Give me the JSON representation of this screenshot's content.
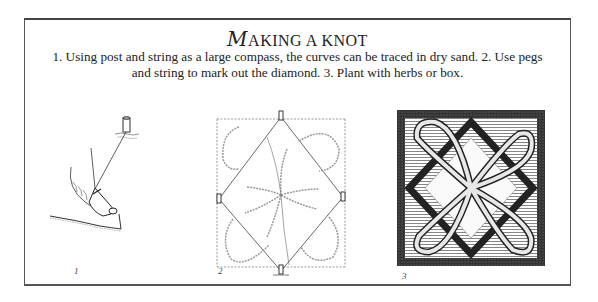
{
  "title": {
    "initial": "M",
    "rest": "AKING A KNOT"
  },
  "caption": "1.  Using post and string as a large compass, the curves can be traced in dry sand. 2.  Use pegs and string to mark out the diamond. 3.  Plant with herbs or box.",
  "figures": [
    {
      "label": "1",
      "description": "hand holding bottle tracing a curve with post and string"
    },
    {
      "label": "2",
      "description": "diamond marked with pegs and string over traced curves"
    },
    {
      "label": "3",
      "description": "finished knot garden planted with herbs or box"
    }
  ]
}
